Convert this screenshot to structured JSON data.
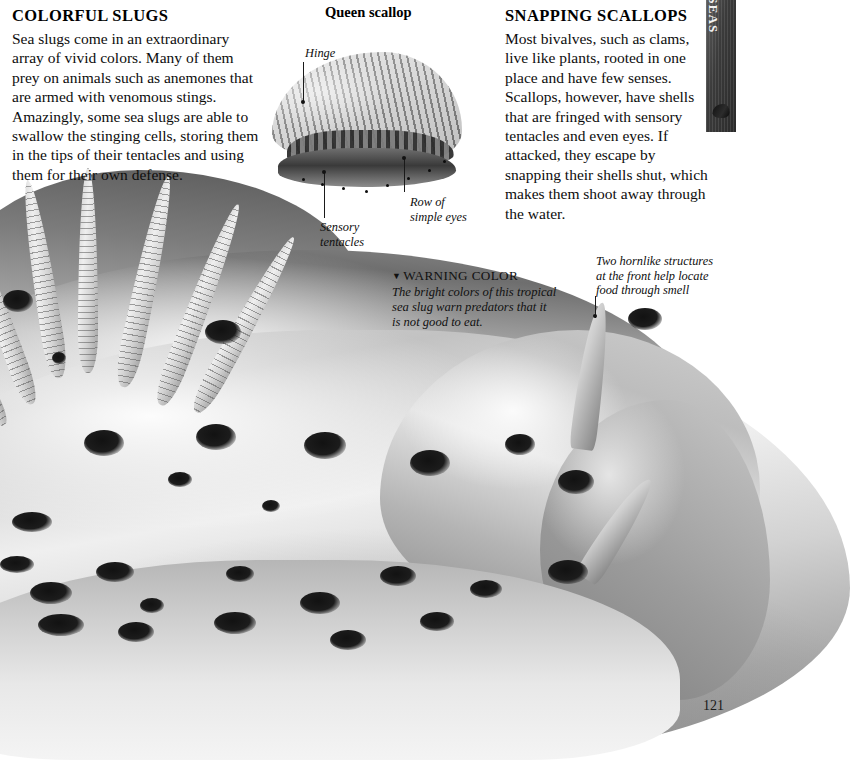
{
  "page": {
    "number": "121",
    "section_tab": {
      "label": "OW SEAS",
      "icon": "shell-icon"
    }
  },
  "left_column": {
    "heading": "COLORFUL SLUGS",
    "body": "Sea slugs come in an extraordinary array of vivid colors. Many of them prey on animals such as anemones that are armed with venomous stings. Amazingly, some sea slugs are able to swallow the stinging cells, storing them in the tips of their tentacles and using them for their own defense."
  },
  "right_column": {
    "heading": "SNAPPING SCALLOPS",
    "body": "Most bivalves, such as clams, live like plants, rooted in one place and have few senses. Scallops, however, have shells that are fringed with sensory tentacles and even eyes. If attacked, they escape by snapping their shells shut, which makes them shoot away through the water."
  },
  "scallop_figure": {
    "title": "Queen scallop",
    "labels": {
      "hinge": "Hinge",
      "sensory_tentacles": "Sensory\ntentacles",
      "sensory_tentacles_line1": "Sensory",
      "sensory_tentacles_line2": "tentacles",
      "row_of_eyes_line1": "Row of",
      "row_of_eyes_line2": "simple eyes"
    }
  },
  "slug_figure": {
    "warning_caption": {
      "marker": "▼",
      "title": "WARNING COLOR",
      "line1": "The bright colors of this tropical",
      "line2": "sea slug warn predators that it",
      "line3": "is not good to eat."
    },
    "horn_caption": {
      "line1": "Two hornlike structures",
      "line2": "at the front help locate",
      "line3": "food through smell"
    }
  },
  "colors": {
    "page_background": "#ffffff",
    "text": "#0d0d0d",
    "tab_background": "#3b3b3b",
    "tab_text": "#f2f2f2"
  }
}
